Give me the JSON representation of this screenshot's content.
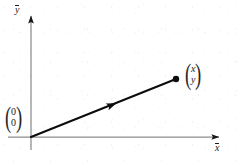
{
  "figure": {
    "background_color": "#ffffff",
    "width": 239,
    "height": 163
  },
  "axes": {
    "color": "#8c8c8c",
    "arrow_color": "#1a1a1a",
    "x_axis": {
      "label": "x",
      "has_overbar": true,
      "start": [
        8,
        137
      ],
      "end": [
        225,
        137
      ],
      "arrow_at": "end"
    },
    "y_axis": {
      "label": "y",
      "has_overbar": true,
      "start": [
        31,
        150
      ],
      "end": [
        31,
        10
      ],
      "arrow_at": "end"
    },
    "origin": [
      31,
      137
    ]
  },
  "vector": {
    "color": "#0d0d0d",
    "stroke_width": 2.1,
    "from": [
      31,
      137
    ],
    "to": [
      176,
      79
    ],
    "midpoint_arrow_at": [
      110,
      107
    ],
    "endpoint_dot_radius": 3.2
  },
  "labels": {
    "origin_vector": {
      "top": "0",
      "bottom": "0",
      "open_paren": "(",
      "close_paren": ")"
    },
    "point_vector": {
      "top": "x",
      "bottom": "y",
      "open_paren": "(",
      "close_paren": ")"
    }
  }
}
